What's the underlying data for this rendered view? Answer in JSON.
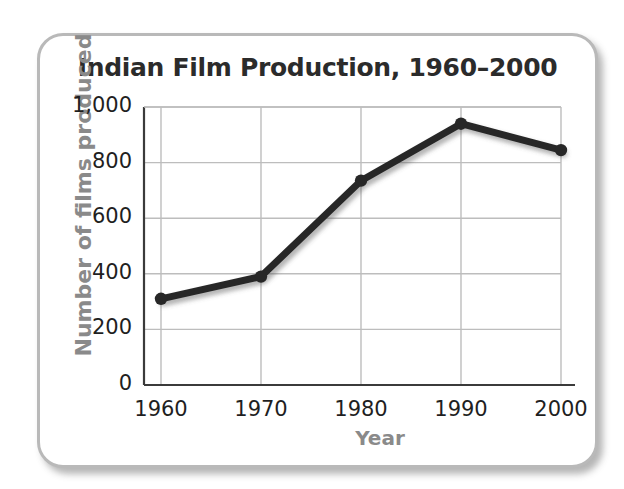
{
  "chart_data": {
    "type": "line",
    "title": "Indian Film Production, 1960–2000",
    "xlabel": "Year",
    "ylabel": "Number of films produced",
    "categories": [
      1960,
      1970,
      1980,
      1990,
      2000
    ],
    "x_tick_labels": [
      "1960",
      "1970",
      "1980",
      "1990",
      "2000"
    ],
    "values": [
      310,
      390,
      735,
      940,
      845
    ],
    "ylim": [
      0,
      1000
    ],
    "y_ticks": [
      0,
      200,
      400,
      600,
      800,
      1000
    ],
    "y_tick_labels": [
      "0",
      "200",
      "400",
      "600",
      "800",
      "1,000"
    ],
    "grid": true,
    "legend": false,
    "series_color": "#272727",
    "grid_color": "#bdbdbd",
    "axis_color": "#3b3b3b",
    "marker": "circle"
  },
  "frame": {
    "border_color": "#b9b9b9",
    "background_color": "#ffffff"
  },
  "title_color": "#2b2b2b",
  "axis_title_color": "#8a8a8a"
}
